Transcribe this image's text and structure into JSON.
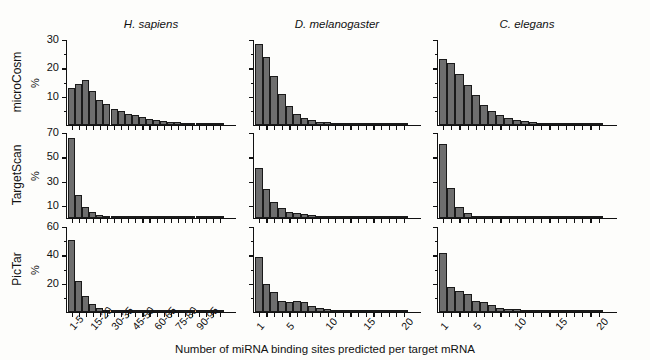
{
  "figure": {
    "xaxis_title": "Number of miRNA binding sites predicted per target mRNA",
    "percent_symbol": "%"
  },
  "species": [
    {
      "key": "hsapiens",
      "label": "H. sapiens"
    },
    {
      "key": "dmelanogaster",
      "label": "D. melanogaster"
    },
    {
      "key": "celegans",
      "label": "C. elegans"
    }
  ],
  "algorithms": [
    {
      "key": "microcosm",
      "label": "microCosm"
    },
    {
      "key": "targetscan",
      "label": "TargetScan"
    },
    {
      "key": "pictar",
      "label": "PicTar"
    }
  ],
  "chart_data": [
    {
      "type": "bar",
      "title": "microCosm / H. sapiens",
      "algorithm": "microCosm",
      "species": "H. sapiens",
      "xlabel": "Number of miRNA binding sites predicted per target mRNA",
      "ylabel": "%",
      "ylim": [
        0,
        30
      ],
      "yticks": [
        10,
        20,
        30
      ],
      "ytick_labels": [
        "10",
        "20",
        "30"
      ],
      "grid": false,
      "categories": [
        "1-5",
        "5-10",
        "10-15",
        "15-20",
        "20-25",
        "25-30",
        "30-35",
        "35-40",
        "40-45",
        "45-50",
        "50-55",
        "55-60",
        "60-65",
        "65-70",
        "70-75",
        "75-80",
        "80-85",
        "85-90",
        "90-95",
        "95-100",
        "100-105",
        "105-110"
      ],
      "xtick_labels": [
        "1-5",
        "15-20",
        "30-35",
        "45-50",
        "60-65",
        "75-80",
        "90-95"
      ],
      "xtick_positions": [
        0,
        3,
        6,
        9,
        12,
        15,
        18
      ],
      "values": [
        13.0,
        14.5,
        16.0,
        12.0,
        9.0,
        7.5,
        5.5,
        4.8,
        4.0,
        3.4,
        2.7,
        2.2,
        1.8,
        1.4,
        1.1,
        0.9,
        0.7,
        0.5,
        0.4,
        0.3,
        0.25,
        0.2
      ]
    },
    {
      "type": "bar",
      "title": "microCosm / D. melanogaster",
      "algorithm": "microCosm",
      "species": "D. melanogaster",
      "xlabel": "Number of miRNA binding sites predicted per target mRNA",
      "ylabel": "%",
      "ylim": [
        0,
        30
      ],
      "yticks": [
        10,
        20,
        30
      ],
      "ytick_labels": [
        "",
        "",
        ""
      ],
      "grid": false,
      "categories": [
        "1",
        "2",
        "3",
        "4",
        "5",
        "6",
        "7",
        "8",
        "9",
        "10",
        "11",
        "12",
        "13",
        "14",
        "15",
        "16",
        "17",
        "18",
        "19",
        "20"
      ],
      "xtick_labels": [
        "1",
        "5",
        "10",
        "15",
        "20"
      ],
      "xtick_positions": [
        0,
        4,
        9,
        14,
        19
      ],
      "values": [
        28.6,
        23.9,
        17.3,
        10.8,
        6.7,
        4.0,
        2.6,
        1.8,
        1.2,
        0.9,
        0.6,
        0.45,
        0.3,
        0.25,
        0.2,
        0.15,
        0.12,
        0.1,
        0.08,
        0.06
      ]
    },
    {
      "type": "bar",
      "title": "microCosm / C. elegans",
      "algorithm": "microCosm",
      "species": "C. elegans",
      "xlabel": "Number of miRNA binding sites predicted per target mRNA",
      "ylabel": "%",
      "ylim": [
        0,
        30
      ],
      "yticks": [
        10,
        20,
        30
      ],
      "ytick_labels": [
        "",
        "",
        ""
      ],
      "grid": false,
      "categories": [
        "1",
        "2",
        "3",
        "4",
        "5",
        "6",
        "7",
        "8",
        "9",
        "10",
        "11",
        "12",
        "13",
        "14",
        "15",
        "16",
        "17",
        "18",
        "19",
        "20"
      ],
      "xtick_labels": [
        "1",
        "5",
        "10",
        "15",
        "20"
      ],
      "xtick_positions": [
        0,
        4,
        9,
        14,
        19
      ],
      "values": [
        23.2,
        22.0,
        18.0,
        14.0,
        10.5,
        7.0,
        4.8,
        3.4,
        2.4,
        1.8,
        1.3,
        1.0,
        0.8,
        0.6,
        0.5,
        0.4,
        0.3,
        0.25,
        0.2,
        0.15
      ]
    },
    {
      "type": "bar",
      "title": "TargetScan / H. sapiens",
      "algorithm": "TargetScan",
      "species": "H. sapiens",
      "xlabel": "Number of miRNA binding sites predicted per target mRNA",
      "ylabel": "%",
      "ylim": [
        0,
        70
      ],
      "yticks": [
        10,
        30,
        50,
        70
      ],
      "ytick_labels": [
        "10",
        "30",
        "50",
        "70"
      ],
      "grid": false,
      "categories": [
        "1-5",
        "5-10",
        "10-15",
        "15-20",
        "20-25",
        "25-30",
        "30-35",
        "35-40",
        "40-45",
        "45-50",
        "50-55",
        "55-60",
        "60-65",
        "65-70",
        "70-75",
        "75-80",
        "80-85",
        "85-90",
        "90-95",
        "95-100",
        "100-105",
        "105-110"
      ],
      "xtick_labels": [
        "1-5",
        "15-20",
        "30-35",
        "45-50",
        "60-65",
        "75-80",
        "90-95"
      ],
      "xtick_positions": [
        0,
        3,
        6,
        9,
        12,
        15,
        18
      ],
      "values": [
        66.0,
        19.0,
        9.0,
        5.0,
        2.6,
        1.5,
        0.9,
        0.6,
        0.4,
        0.3,
        0.2,
        0.15,
        0.1,
        0.08,
        0.06,
        0.05,
        0.04,
        0.03,
        0.02,
        0.02,
        0.01,
        0.01
      ]
    },
    {
      "type": "bar",
      "title": "TargetScan / D. melanogaster",
      "algorithm": "TargetScan",
      "species": "D. melanogaster",
      "xlabel": "Number of miRNA binding sites predicted per target mRNA",
      "ylabel": "%",
      "ylim": [
        0,
        70
      ],
      "yticks": [
        10,
        30,
        50,
        70
      ],
      "ytick_labels": [
        "",
        "",
        "",
        ""
      ],
      "grid": false,
      "categories": [
        "1",
        "2",
        "3",
        "4",
        "5",
        "6",
        "7",
        "8",
        "9",
        "10",
        "11",
        "12",
        "13",
        "14",
        "15",
        "16",
        "17",
        "18",
        "19",
        "20"
      ],
      "xtick_labels": [
        "1",
        "5",
        "10",
        "15",
        "20"
      ],
      "xtick_positions": [
        0,
        4,
        9,
        14,
        19
      ],
      "values": [
        41.0,
        24.0,
        13.0,
        8.5,
        5.0,
        3.8,
        3.0,
        2.2,
        1.5,
        1.0,
        0.7,
        0.5,
        0.35,
        0.25,
        0.2,
        0.15,
        0.1,
        0.08,
        0.06,
        0.05
      ]
    },
    {
      "type": "bar",
      "title": "TargetScan / C. elegans",
      "algorithm": "TargetScan",
      "species": "C. elegans",
      "xlabel": "Number of miRNA binding sites predicted per target mRNA",
      "ylabel": "%",
      "ylim": [
        0,
        70
      ],
      "yticks": [
        10,
        30,
        50,
        70
      ],
      "ytick_labels": [
        "",
        "",
        "",
        ""
      ],
      "grid": false,
      "categories": [
        "1",
        "2",
        "3",
        "4",
        "5",
        "6",
        "7",
        "8",
        "9",
        "10",
        "11",
        "12",
        "13",
        "14",
        "15",
        "16",
        "17",
        "18",
        "19",
        "20"
      ],
      "xtick_labels": [
        "1",
        "5",
        "10",
        "15",
        "20"
      ],
      "xtick_positions": [
        0,
        4,
        9,
        14,
        19
      ],
      "values": [
        61.0,
        25.0,
        9.0,
        4.0,
        1.6,
        0.8,
        0.4,
        0.25,
        0.15,
        0.1,
        0.08,
        0.06,
        0.05,
        0.04,
        0.03,
        0.02,
        0.02,
        0.01,
        0.01,
        0.01
      ]
    },
    {
      "type": "bar",
      "title": "PicTar / H. sapiens",
      "algorithm": "PicTar",
      "species": "H. sapiens",
      "xlabel": "Number of miRNA binding sites predicted per target mRNA",
      "ylabel": "%",
      "ylim": [
        0,
        60
      ],
      "yticks": [
        20,
        40,
        60
      ],
      "ytick_labels": [
        "20",
        "40",
        "60"
      ],
      "grid": false,
      "categories": [
        "1-5",
        "5-10",
        "10-15",
        "15-20",
        "20-25",
        "25-30",
        "30-35",
        "35-40",
        "40-45",
        "45-50",
        "50-55",
        "55-60",
        "60-65",
        "65-70",
        "70-75",
        "75-80",
        "80-85",
        "85-90",
        "90-95",
        "95-100",
        "100-105",
        "105-110"
      ],
      "xtick_labels": [
        "1-5",
        "15-20",
        "30-35",
        "45-50",
        "60-65",
        "75-80",
        "90-95"
      ],
      "xtick_positions": [
        0,
        3,
        6,
        9,
        12,
        15,
        18
      ],
      "values": [
        51.0,
        22.0,
        11.0,
        6.0,
        3.0,
        1.6,
        0.9,
        0.6,
        0.4,
        0.3,
        0.2,
        0.15,
        0.1,
        0.08,
        0.06,
        0.05,
        0.04,
        0.03,
        0.02,
        0.02,
        0.01,
        0.01
      ]
    },
    {
      "type": "bar",
      "title": "PicTar / D. melanogaster",
      "algorithm": "PicTar",
      "species": "D. melanogaster",
      "xlabel": "Number of miRNA binding sites predicted per target mRNA",
      "ylabel": "%",
      "ylim": [
        0,
        60
      ],
      "yticks": [
        20,
        40,
        60
      ],
      "ytick_labels": [
        "",
        "",
        ""
      ],
      "grid": false,
      "categories": [
        "1",
        "2",
        "3",
        "4",
        "5",
        "6",
        "7",
        "8",
        "9",
        "10",
        "11",
        "12",
        "13",
        "14",
        "15",
        "16",
        "17",
        "18",
        "19",
        "20"
      ],
      "xtick_labels": [
        "1",
        "5",
        "10",
        "15",
        "20"
      ],
      "xtick_positions": [
        0,
        4,
        9,
        14,
        19
      ],
      "values": [
        39.0,
        20.0,
        14.0,
        8.0,
        7.0,
        7.5,
        7.0,
        4.5,
        2.5,
        2.0,
        0.8,
        0.4,
        0.25,
        0.15,
        0.1,
        0.08,
        0.06,
        0.05,
        0.04,
        0.03
      ]
    },
    {
      "type": "bar",
      "title": "PicTar / C. elegans",
      "algorithm": "PicTar",
      "species": "C. elegans",
      "xlabel": "Number of miRNA binding sites predicted per target mRNA",
      "ylabel": "%",
      "ylim": [
        0,
        60
      ],
      "yticks": [
        20,
        40,
        60
      ],
      "ytick_labels": [
        "",
        "",
        ""
      ],
      "grid": false,
      "categories": [
        "1",
        "2",
        "3",
        "4",
        "5",
        "6",
        "7",
        "8",
        "9",
        "10",
        "11",
        "12",
        "13",
        "14",
        "15",
        "16",
        "17",
        "18",
        "19",
        "20"
      ],
      "xtick_labels": [
        "1",
        "5",
        "10",
        "15",
        "20"
      ],
      "xtick_positions": [
        0,
        4,
        9,
        14,
        19
      ],
      "values": [
        42.0,
        18.0,
        15.0,
        13.0,
        7.5,
        7.0,
        5.0,
        3.0,
        2.2,
        1.8,
        0.8,
        0.5,
        0.3,
        0.2,
        0.15,
        0.1,
        0.08,
        0.06,
        0.05,
        0.04
      ]
    }
  ]
}
